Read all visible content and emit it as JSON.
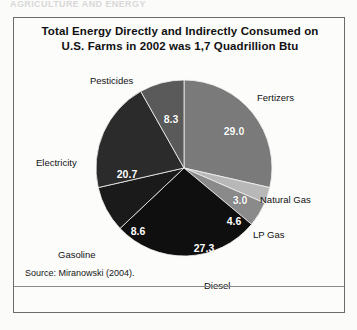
{
  "page": {
    "header_remnant": "AGRICULTURE AND ENERGY"
  },
  "figure": {
    "title_line1": "Total Energy Directly and Indirectly Consumed on",
    "title_line2": "U.S. Farms in 2002 was 1,7 Quadrillion Btu",
    "source": "Source: Miranowski (2004)."
  },
  "chart_data": {
    "type": "pie",
    "title": "Total Energy Directly and Indirectly Consumed on U.S. Farms in 2002 was 1,7 Quadrillion Btu",
    "subtitle": "",
    "xlabel": "",
    "ylabel": "",
    "units": "percent of total",
    "total_label": "1,7 Quadrillion Btu",
    "grid": false,
    "legend": "none (direct slice labels)",
    "start_angle_deg": 0,
    "direction": "clockwise",
    "source": "Miranowski (2004).",
    "categories": [
      "Fertizers",
      "Natural Gas",
      "LP Gas",
      "Diesel",
      "Gasoline",
      "Electricity",
      "Pesticides"
    ],
    "values": [
      29.0,
      3.0,
      4.6,
      27.3,
      8.6,
      20.7,
      8.3
    ],
    "value_labels": [
      "29.0",
      "3.0",
      "4.6",
      "27.3",
      "8.6",
      "20.7",
      "8.3"
    ],
    "colors": [
      "#7a7a7a",
      "#b8b8b8",
      "#8a8a8a",
      "#0f0f0f",
      "#1a1a1a",
      "#2b2b2b",
      "#5a5a5a"
    ],
    "slices": [
      {
        "name": "Fertizers",
        "value": 29.0,
        "label": "29.0",
        "color": "#7a7a7a",
        "value_x": 220,
        "value_y": 113,
        "label_x": 243,
        "label_y": 74,
        "label_align": "left"
      },
      {
        "name": "Natural Gas",
        "value": 3.0,
        "label": "3.0",
        "color": "#b8b8b8",
        "value_x": 226,
        "value_y": 182,
        "label_x": 246,
        "label_y": 176,
        "label_align": "left"
      },
      {
        "name": "LP Gas",
        "value": 4.6,
        "label": "4.6",
        "color": "#8a8a8a",
        "value_x": 220,
        "value_y": 203,
        "label_x": 239,
        "label_y": 211,
        "label_align": "left"
      },
      {
        "name": "Diesel",
        "value": 27.3,
        "label": "27.3",
        "color": "#0f0f0f",
        "value_x": 190,
        "value_y": 230,
        "label_x": 190,
        "label_y": 262,
        "label_align": "left"
      },
      {
        "name": "Gasoline",
        "value": 8.6,
        "label": "8.6",
        "color": "#1a1a1a",
        "value_x": 124,
        "value_y": 213,
        "label_x": 44,
        "label_y": 231,
        "label_align": "left"
      },
      {
        "name": "Electricity",
        "value": 20.7,
        "label": "20.7",
        "color": "#2b2b2b",
        "value_x": 113,
        "value_y": 156,
        "label_x": 22,
        "label_y": 139,
        "label_align": "left"
      },
      {
        "name": "Pesticides",
        "value": 8.3,
        "label": "8.3",
        "color": "#5a5a5a",
        "value_x": 157,
        "value_y": 101,
        "label_x": 76,
        "label_y": 57,
        "label_align": "left"
      }
    ],
    "geometry": {
      "cx": 170,
      "cy": 150,
      "r": 88
    }
  }
}
